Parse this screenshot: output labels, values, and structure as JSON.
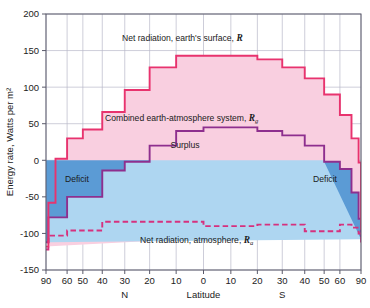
{
  "chart_data": {
    "type": "area",
    "title": "",
    "xlabel": "Latitude",
    "ylabel": "Energy rate, Watts per m²",
    "ylim": [
      -150,
      200
    ],
    "ytick_values": [
      200,
      150,
      100,
      50,
      0,
      -50,
      -100,
      -150
    ],
    "ytick_labels": [
      "200",
      "150",
      "100",
      "50",
      "0",
      "-50",
      "-100",
      "-150"
    ],
    "xtick_latitudes": [
      90,
      60,
      50,
      40,
      30,
      20,
      10,
      0,
      -10,
      -20,
      -30,
      -40,
      -50,
      -60,
      -90
    ],
    "xtick_labels": [
      "90",
      "60",
      "50",
      "40",
      "30",
      "20",
      "10",
      "0",
      "10",
      "20",
      "30",
      "40",
      "50",
      "60",
      "90"
    ],
    "x_scale": "sine-latitude (equal area)",
    "hemisphere_labels": [
      {
        "text": "N",
        "latitude": 30
      },
      {
        "text": "S",
        "latitude": -30
      }
    ],
    "grid": true,
    "legend_position": "inline-annotations",
    "bands": [
      {
        "name": "Surplus",
        "color": "#f9cfe0",
        "description": "area between R and R_a above zero"
      },
      {
        "name": "Deficit",
        "color": "#5b9bd5",
        "description": "area between R_g and R_a below zero at high latitudes"
      }
    ],
    "annotations": [
      {
        "id": "r-label",
        "text": "Net radiation, earth's surface, ",
        "symbol": "R",
        "subscript": ""
      },
      {
        "id": "rg-label",
        "text": "Combined earth-atmosphere system, ",
        "symbol": "R",
        "subscript": "g"
      },
      {
        "id": "surplus-label",
        "text": "Surplus",
        "symbol": "",
        "subscript": ""
      },
      {
        "id": "ra-label",
        "text": "Net radiation, atmosphere, ",
        "symbol": "R",
        "subscript": "a"
      },
      {
        "id": "deficit-left-label",
        "text": "Deficit",
        "symbol": "",
        "subscript": ""
      },
      {
        "id": "deficit-right-label",
        "text": "Deficit",
        "symbol": "",
        "subscript": ""
      }
    ],
    "series": [
      {
        "name": "Net radiation, earth's surface, R",
        "key": "R",
        "color": "#e8336e",
        "style": "step-solid",
        "fill": "#f9cfe0",
        "bin_edges_lat": [
          90,
          80,
          70,
          60,
          50,
          40,
          30,
          20,
          10,
          0,
          -10,
          -20,
          -30,
          -40,
          -50,
          -60,
          -70,
          -80,
          -90
        ],
        "values": [
          -118,
          -58,
          2,
          30,
          42,
          66,
          96,
          127,
          143,
          143,
          143,
          138,
          127,
          112,
          90,
          62,
          30,
          -3,
          -95
        ]
      },
      {
        "name": "Combined earth-atmosphere system, Rg",
        "key": "Rg",
        "color": "#8e2f8e",
        "style": "step-solid",
        "fill": "#aed6f1",
        "bin_edges_lat": [
          90,
          80,
          70,
          60,
          50,
          40,
          30,
          20,
          10,
          0,
          -10,
          -20,
          -30,
          -40,
          -50,
          -60,
          -70,
          -80,
          -90
        ],
        "values": [
          -112,
          -78,
          -78,
          -50,
          -50,
          -14,
          -2,
          20,
          40,
          45,
          45,
          40,
          34,
          20,
          -2,
          -12,
          -44,
          -80,
          -108
        ]
      },
      {
        "name": "Net radiation, atmosphere, Ra",
        "key": "Ra",
        "color": "#d6317e",
        "style": "step-dashed",
        "fill": "none",
        "bin_edges_lat": [
          90,
          80,
          70,
          60,
          50,
          40,
          30,
          20,
          10,
          0,
          -10,
          -20,
          -30,
          -40,
          -50,
          -60,
          -70,
          -80,
          -90
        ],
        "values": [
          -122,
          -103,
          -103,
          -96,
          -96,
          -84,
          -84,
          -84,
          -84,
          -90,
          -90,
          -88,
          -88,
          -97,
          -97,
          -88,
          -92,
          -100,
          -115
        ]
      }
    ]
  },
  "axis": {
    "y_title": "Energy rate, Watts per m²",
    "x_title": "Latitude",
    "north_label": "N",
    "south_label": "S"
  },
  "labels": {
    "r_text": "Net radiation, earth's surface,",
    "r_sym": "R",
    "rg_text": "Combined earth-atmosphere system,",
    "rg_sym": "R",
    "rg_sub": "g",
    "ra_text": "Net radiation, atmosphere,",
    "ra_sym": "R",
    "ra_sub": "a",
    "surplus": "Surplus",
    "deficit_left": "Deficit",
    "deficit_right": "Deficit"
  },
  "colors": {
    "r_line": "#e8336e",
    "r_fill": "#f9cfe0",
    "rg_line": "#8e2f8e",
    "rg_fill": "#aed6f1",
    "deficit_fill": "#5b9bd5",
    "ra_line": "#d6317e",
    "grid": "#b8b8c8",
    "axis": "#5a5a6a",
    "text": "#1a1a1a"
  }
}
